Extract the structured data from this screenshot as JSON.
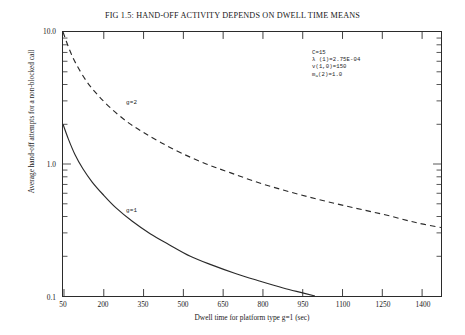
{
  "chart_data": {
    "type": "line",
    "title": "FIG 1.5:  HAND-OFF ACTIVITY DEPENDS ON DWELL TIME MEANS",
    "xlabel": "Dwell time for platform type g=1  (sec)",
    "ylabel": "Average hand-off attempts for a non-blocked call",
    "yscale": "log",
    "xscale": "linear",
    "xlim": [
      50,
      1475
    ],
    "ylim": [
      0.1,
      10.0
    ],
    "grid": false,
    "legend_position": "inline-annotation",
    "xticks": [
      50,
      200,
      350,
      500,
      650,
      800,
      950,
      1100,
      1250,
      1400
    ],
    "xtick_labels": [
      "50",
      "200",
      "350",
      "500",
      "650",
      "800",
      "950",
      "1100",
      "1250",
      "1400"
    ],
    "yticks": [
      0.1,
      1.0,
      10.0
    ],
    "ytick_labels": [
      "0.1",
      "1.0",
      "10.0"
    ],
    "series": [
      {
        "name": "g=2",
        "style": "dashed",
        "label": "g=2",
        "x": [
          50,
          75,
          100,
          140,
          180,
          230,
          290,
          350,
          420,
          500,
          590,
          680,
          780,
          880,
          980,
          1080,
          1180,
          1280,
          1380,
          1475
        ],
        "y": [
          10.0,
          7.3,
          5.7,
          4.2,
          3.35,
          2.65,
          2.1,
          1.75,
          1.45,
          1.2,
          1.0,
          0.86,
          0.73,
          0.635,
          0.56,
          0.5,
          0.45,
          0.405,
          0.36,
          0.33
        ]
      },
      {
        "name": "g=1",
        "style": "solid",
        "label": "g=1",
        "x": [
          50,
          70,
          95,
          125,
          160,
          200,
          250,
          310,
          380,
          450,
          530,
          610,
          700,
          790,
          880,
          950,
          1000
        ],
        "y": [
          2.0,
          1.55,
          1.18,
          0.92,
          0.73,
          0.59,
          0.465,
          0.37,
          0.295,
          0.245,
          0.2,
          0.172,
          0.148,
          0.13,
          0.115,
          0.106,
          0.1
        ]
      }
    ],
    "annotations": [
      {
        "text": "C=15"
      },
      {
        "text": "λ (1)=2.75E-04"
      },
      {
        "text": "v(1,0)=150"
      },
      {
        "text": "m",
        "subscript": "a",
        "suffix": "(2)=1.0"
      }
    ]
  },
  "annotation_lines": {
    "line1": "C=15",
    "line2": "λ (1)=2.75E-04",
    "line3": "v(1,0)=150",
    "line4_main": "m",
    "line4_sub": "a",
    "line4_tail": "(2)=1.0"
  },
  "colors": {
    "ink": "#1a1a1a",
    "frame": "#2b2b2b",
    "curve": "#2a2a2a",
    "background": "#ffffff"
  }
}
